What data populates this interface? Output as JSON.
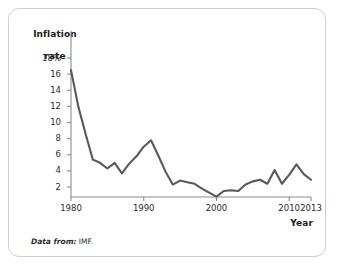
{
  "figure": {
    "source_note_lead": "Data from:",
    "source_note_value": " IMF."
  },
  "chart_data": {
    "type": "line",
    "title": "",
    "subtitle": "",
    "xlabel": "Year",
    "ylabel": "Inflation\nrate",
    "ylabel_line1": "Inflation",
    "ylabel_line2": "rate",
    "xlim": [
      1980,
      2013
    ],
    "ylim": [
      0,
      19
    ],
    "grid": false,
    "legend": "none",
    "line_color": "#595959",
    "axis_color": "#8c8c8c",
    "y_ticks": [
      18,
      16,
      14,
      12,
      10,
      8,
      6,
      4,
      2
    ],
    "y_tick_labels": [
      "18%",
      "16",
      "14",
      "12",
      "10",
      "8",
      "6",
      "4",
      "2"
    ],
    "x_ticks": [
      1980,
      1990,
      2000,
      2010,
      2013
    ],
    "x_tick_labels": [
      "1980",
      "1990",
      "2000",
      "2010",
      "2013"
    ],
    "series": [
      {
        "name": "Inflation rate",
        "x": [
          1980,
          1981,
          1982,
          1983,
          1984,
          1985,
          1986,
          1987,
          1988,
          1989,
          1990,
          1991,
          1992,
          1993,
          1994,
          1995,
          1996,
          1997,
          1998,
          1999,
          2000,
          2001,
          2002,
          2003,
          2004,
          2005,
          2006,
          2007,
          2008,
          2009,
          2010,
          2011,
          2012,
          2013
        ],
        "values": [
          16.5,
          12.0,
          8.6,
          5.4,
          5.0,
          4.3,
          5.0,
          3.7,
          4.9,
          5.8,
          7.0,
          7.8,
          5.9,
          3.9,
          2.3,
          2.8,
          2.6,
          2.4,
          1.8,
          1.3,
          0.8,
          1.5,
          1.6,
          1.5,
          2.3,
          2.7,
          2.9,
          2.4,
          4.1,
          2.4,
          3.5,
          4.8,
          3.6,
          2.9
        ]
      }
    ]
  }
}
